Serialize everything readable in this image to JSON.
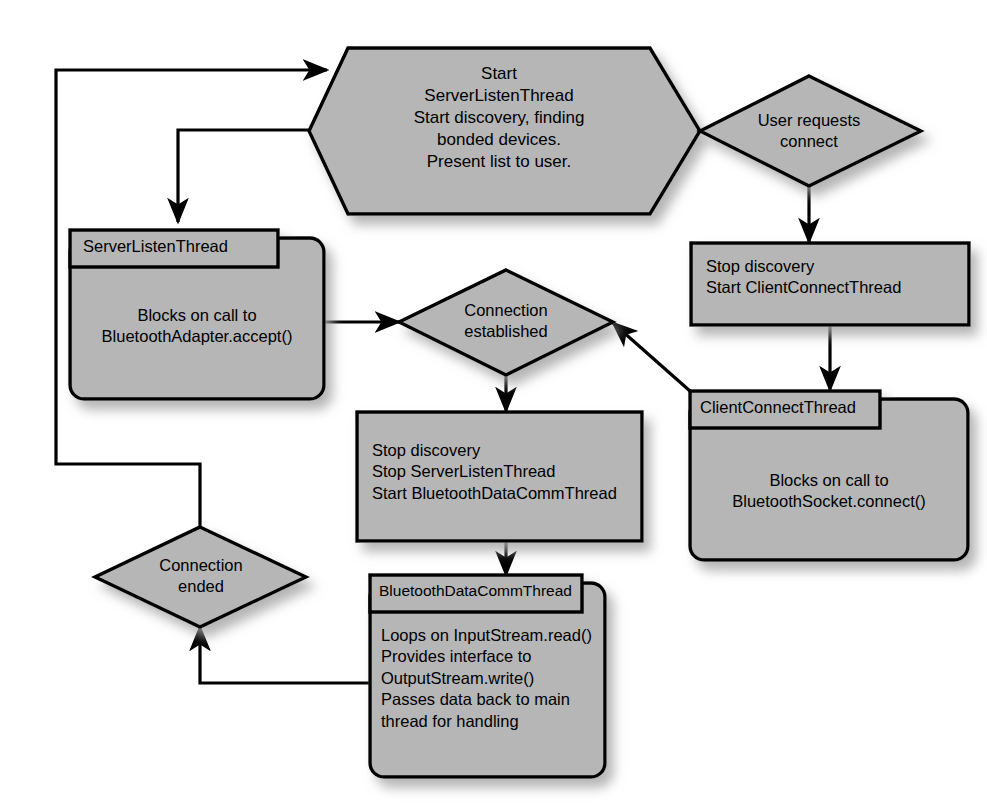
{
  "diagram": {
    "canvas": {
      "width": 987,
      "height": 808
    },
    "colors": {
      "node_fill": "#b6b6b6",
      "node_stroke": "#000000",
      "connector": "#000000",
      "background": "#ffffff",
      "shadow": "#c9c9c9"
    }
  },
  "nodes": {
    "start_hexagon": {
      "shape": "hexagon",
      "lines": [
        "Start",
        "ServerListenThread",
        "Start discovery, finding",
        "bonded devices.",
        "Present list to user."
      ]
    },
    "user_requests_connect": {
      "shape": "diamond",
      "lines": [
        "User requests",
        "connect"
      ]
    },
    "stop_discovery_start_client": {
      "shape": "rectangle",
      "lines": [
        "Stop discovery",
        "Start ClientConnectThread"
      ]
    },
    "client_connect_thread": {
      "shape": "thread-box",
      "title": "ClientConnectThread",
      "lines": [
        "Blocks on call to",
        "BluetoothSocket.connect()"
      ]
    },
    "server_listen_thread": {
      "shape": "thread-box",
      "title": "ServerListenThread",
      "lines": [
        "Blocks on call to",
        "BluetoothAdapter.accept()"
      ]
    },
    "connection_established": {
      "shape": "diamond",
      "lines": [
        "Connection",
        "established"
      ]
    },
    "stop_discovery_start_comm": {
      "shape": "rectangle",
      "lines": [
        "Stop discovery",
        "Stop ServerListenThread",
        "Start BluetoothDataCommThread"
      ]
    },
    "bluetooth_data_comm_thread": {
      "shape": "thread-box",
      "title": "BluetoothDataCommThread",
      "lines": [
        "Loops on InputStream.read()",
        "Provides interface to",
        "OutputStream.write()",
        "Passes data back to main",
        "thread for handling"
      ]
    },
    "connection_ended": {
      "shape": "diamond",
      "lines": [
        "Connection",
        "ended"
      ]
    }
  },
  "edges": [
    {
      "name": "loop-back-to-start",
      "from": "connection_ended",
      "to": "start_hexagon",
      "arrow": true
    },
    {
      "name": "start-to-user-requests",
      "from": "start_hexagon",
      "to": "user_requests_connect",
      "arrow": true
    },
    {
      "name": "start-to-server-listen",
      "from": "start_hexagon",
      "to": "server_listen_thread",
      "arrow": true
    },
    {
      "name": "user-requests-to-stop",
      "from": "user_requests_connect",
      "to": "stop_discovery_start_client",
      "arrow": true
    },
    {
      "name": "stop-to-client-thread",
      "from": "stop_discovery_start_client",
      "to": "client_connect_thread",
      "arrow": true
    },
    {
      "name": "client-to-established",
      "from": "client_connect_thread",
      "to": "connection_established",
      "arrow": true
    },
    {
      "name": "server-to-established",
      "from": "server_listen_thread",
      "to": "connection_established",
      "arrow": true
    },
    {
      "name": "established-to-stop",
      "from": "connection_established",
      "to": "stop_discovery_start_comm",
      "arrow": true
    },
    {
      "name": "stop-to-comm-thread",
      "from": "stop_discovery_start_comm",
      "to": "bluetooth_data_comm_thread",
      "arrow": true
    },
    {
      "name": "comm-to-connection-ended",
      "from": "bluetooth_data_comm_thread",
      "to": "connection_ended",
      "arrow": true
    }
  ]
}
